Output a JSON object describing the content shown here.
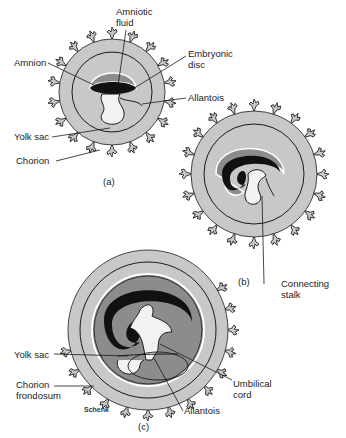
{
  "figure": {
    "panels": [
      {
        "id": "a",
        "caption": "(a)"
      },
      {
        "id": "b",
        "caption": "(b)"
      },
      {
        "id": "c",
        "caption": "(c)"
      }
    ],
    "signature": "Schenk",
    "colors": {
      "chorion_fill": "#c8c8c8",
      "amniotic_fluid": "#8c8c8c",
      "embryo": "#111111",
      "yolk_sac": "#f2f2f2",
      "outline": "#1a1a1a"
    }
  },
  "labels": {
    "a": {
      "amniotic_fluid": "Amniotic\nfluid",
      "embryonic_disc": "Embryonic\ndisc",
      "amnion": "Amnion",
      "allantois": "Allantois",
      "yolk_sac": "Yolk sac",
      "chorion": "Chorion"
    },
    "b": {
      "connecting_stalk": "Connecting\nstalk"
    },
    "c": {
      "yolk_sac": "Yolk sac",
      "chorion_frondosum": "Chorion\nfrondosum",
      "umbilical_cord": "Umbilical\ncord",
      "allantois": "Allantois"
    }
  }
}
